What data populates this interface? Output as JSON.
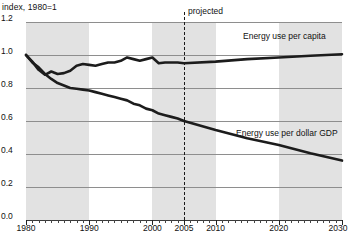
{
  "chart_data": {
    "type": "line",
    "title": "index, 1980=1",
    "xlabel": "",
    "ylabel": "index, 1980=1",
    "xlim": [
      1980,
      2030
    ],
    "ylim": [
      0.0,
      1.2
    ],
    "yticks": [
      "0.0",
      "0.2",
      "0.4",
      "0.6",
      "0.8",
      "1.0",
      "1.2"
    ],
    "ytick_values": [
      0.0,
      0.2,
      0.4,
      0.6,
      0.8,
      1.0,
      1.2
    ],
    "xticks": [
      "1980",
      "1990",
      "2000",
      "2005",
      "2010",
      "2020",
      "2030"
    ],
    "xtick_values": [
      1980,
      1990,
      2000,
      2005,
      2010,
      2020,
      2030
    ],
    "grid": true,
    "legend_position": "inline-annotations",
    "annotations": [
      {
        "text": "projected",
        "x": 2005,
        "note": "vertical dashed divider at 2005 separating history from projection"
      }
    ],
    "shaded_bands": [
      {
        "from": 1980,
        "to": 1990
      },
      {
        "from": 2000,
        "to": 2010
      },
      {
        "from": 2020,
        "to": 2030
      }
    ],
    "series": [
      {
        "name": "Energy use per capita",
        "label_x": 2013,
        "label_y": 1.06,
        "x": [
          1980,
          1981,
          1982,
          1983,
          1984,
          1985,
          1986,
          1987,
          1988,
          1989,
          1990,
          1991,
          1992,
          1993,
          1994,
          1995,
          1996,
          1997,
          1998,
          1999,
          2000,
          2001,
          2002,
          2003,
          2004,
          2005,
          2010,
          2015,
          2020,
          2025,
          2030
        ],
        "values": [
          1.0,
          0.96,
          0.91,
          0.88,
          0.9,
          0.885,
          0.89,
          0.905,
          0.935,
          0.945,
          0.94,
          0.935,
          0.945,
          0.955,
          0.955,
          0.965,
          0.985,
          0.975,
          0.965,
          0.975,
          0.985,
          0.95,
          0.955,
          0.955,
          0.955,
          0.95,
          0.96,
          0.975,
          0.985,
          0.995,
          1.005
        ]
      },
      {
        "name": "Energy use per dollar GDP",
        "label_x": 2014,
        "label_y": 0.565,
        "x": [
          1980,
          1981,
          1982,
          1983,
          1984,
          1985,
          1986,
          1987,
          1988,
          1989,
          1990,
          1991,
          1992,
          1993,
          1994,
          1995,
          1996,
          1997,
          1998,
          1999,
          2000,
          2001,
          2002,
          2003,
          2004,
          2005,
          2010,
          2015,
          2020,
          2025,
          2030
        ],
        "values": [
          1.0,
          0.955,
          0.925,
          0.885,
          0.855,
          0.83,
          0.815,
          0.8,
          0.795,
          0.79,
          0.785,
          0.775,
          0.765,
          0.755,
          0.745,
          0.735,
          0.725,
          0.705,
          0.695,
          0.675,
          0.665,
          0.645,
          0.635,
          0.625,
          0.615,
          0.6,
          0.545,
          0.495,
          0.455,
          0.405,
          0.36
        ]
      }
    ]
  },
  "labels": {
    "axis_title": "index, 1980=1",
    "projected": "projected",
    "series_per_capita": "Energy use per capita",
    "series_per_gdp": "Energy use per dollar GDP",
    "y0": "0.0",
    "y1": "0.2",
    "y2": "0.4",
    "y3": "0.6",
    "y4": "0.8",
    "y5": "1.0",
    "y6": "1.2",
    "x1980": "1980",
    "x1990": "1990",
    "x2000": "2000",
    "x2005": "2005",
    "x2010": "2010",
    "x2020": "2020",
    "x2030": "2030"
  }
}
